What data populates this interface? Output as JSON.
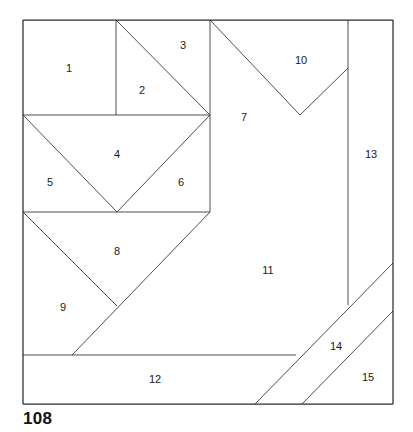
{
  "figure": {
    "caption": "108",
    "colors": {
      "background": "#ffffff",
      "frame_stroke": "#2b2b2b",
      "cut_stroke": "#3a3a3a",
      "label_text": "#1a1a1a",
      "caption_text": "#111111"
    },
    "frame": {
      "x": 23,
      "y": 20,
      "width": 370,
      "height": 384
    },
    "piece_count": 15
  },
  "pieces": [
    {
      "number": "1",
      "label_x": 69,
      "label_y": 69
    },
    {
      "number": "2",
      "label_x": 142,
      "label_y": 91
    },
    {
      "number": "3",
      "label_x": 183,
      "label_y": 46
    },
    {
      "number": "4",
      "label_x": 117,
      "label_y": 155
    },
    {
      "number": "5",
      "label_x": 50,
      "label_y": 183
    },
    {
      "number": "6",
      "label_x": 181,
      "label_y": 183
    },
    {
      "number": "7",
      "label_x": 244,
      "label_y": 118
    },
    {
      "number": "8",
      "label_x": 117,
      "label_y": 252
    },
    {
      "number": "9",
      "label_x": 63,
      "label_y": 308
    },
    {
      "number": "10",
      "label_x": 301,
      "label_y": 61
    },
    {
      "number": "11",
      "label_x": 268,
      "label_y": 271
    },
    {
      "number": "12",
      "label_x": 155,
      "label_y": 380
    },
    {
      "number": "13",
      "label_x": 371,
      "label_y": 155
    },
    {
      "number": "14",
      "label_x": 336,
      "label_y": 347
    },
    {
      "number": "15",
      "label_x": 368,
      "label_y": 378
    }
  ],
  "cut_lines": [
    {
      "name": "vertical-1-2-divider",
      "x1": 116,
      "y1": 20,
      "x2": 116,
      "y2": 115
    },
    {
      "name": "diagonal-2-3-divider",
      "x1": 116,
      "y1": 20,
      "x2": 210,
      "y2": 115
    },
    {
      "name": "vertical-top-mid-spine",
      "x1": 210,
      "y1": 20,
      "x2": 210,
      "y2": 212
    },
    {
      "name": "horizontal-upper-band",
      "x1": 23,
      "y1": 115,
      "x2": 210,
      "y2": 115
    },
    {
      "name": "diagonal-5-4-left",
      "x1": 23,
      "y1": 115,
      "x2": 117,
      "y2": 212
    },
    {
      "name": "diagonal-4-6-right",
      "x1": 210,
      "y1": 115,
      "x2": 117,
      "y2": 212
    },
    {
      "name": "horizontal-mid-band",
      "x1": 23,
      "y1": 212,
      "x2": 210,
      "y2": 212
    },
    {
      "name": "diagonal-9-8-left",
      "x1": 23,
      "y1": 212,
      "x2": 117,
      "y2": 306
    },
    {
      "name": "diagonal-long-11-edge",
      "x1": 210,
      "y1": 212,
      "x2": 72,
      "y2": 355
    },
    {
      "name": "horizontal-12-top",
      "x1": 23,
      "y1": 355,
      "x2": 296,
      "y2": 355
    },
    {
      "name": "diagonal-7-10-upper",
      "x1": 210,
      "y1": 20,
      "x2": 300,
      "y2": 115
    },
    {
      "name": "diagonal-10-13-lower",
      "x1": 300,
      "y1": 115,
      "x2": 348,
      "y2": 68
    },
    {
      "name": "vertical-13-left-edge",
      "x1": 348,
      "y1": 20,
      "x2": 348,
      "y2": 305
    },
    {
      "name": "diagonal-11-14-divider",
      "x1": 255,
      "y1": 404,
      "x2": 393,
      "y2": 263
    },
    {
      "name": "diagonal-14-15-divider",
      "x1": 302,
      "y1": 404,
      "x2": 393,
      "y2": 311
    }
  ],
  "frame_lines": [
    {
      "name": "frame-top",
      "x1": 23,
      "y1": 20,
      "x2": 393,
      "y2": 20
    },
    {
      "name": "frame-right",
      "x1": 393,
      "y1": 20,
      "x2": 393,
      "y2": 404
    },
    {
      "name": "frame-bottom",
      "x1": 393,
      "y1": 404,
      "x2": 23,
      "y2": 404
    },
    {
      "name": "frame-left",
      "x1": 23,
      "y1": 404,
      "x2": 23,
      "y2": 20
    }
  ]
}
